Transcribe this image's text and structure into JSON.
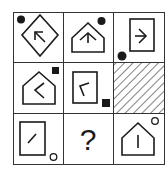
{
  "puzzle": {
    "type": "3x3 figure reasoning matrix",
    "stroke_color": "#1a1a1a",
    "background": "#ffffff",
    "cells": [
      {
        "row": 0,
        "col": 0,
        "shape": "diamond",
        "arrow": "arrow pointing up-left",
        "marker": "filled-circle",
        "marker_position": "top-left"
      },
      {
        "row": 0,
        "col": 1,
        "shape": "house (pentagon)",
        "arrow": "arrow pointing up",
        "marker": "filled-circle",
        "marker_position": "top-right"
      },
      {
        "row": 0,
        "col": 2,
        "shape": "rectangle",
        "arrow": "arrowhead pointing right",
        "marker": "filled-circle",
        "marker_position": "bottom-left"
      },
      {
        "row": 1,
        "col": 0,
        "shape": "house (pentagon)",
        "arrow": "chevron pointing left",
        "marker": "filled-square",
        "marker_position": "top-right"
      },
      {
        "row": 1,
        "col": 1,
        "shape": "rectangle",
        "arrow": "angle stroke",
        "marker": "filled-square",
        "marker_position": "bottom-right"
      },
      {
        "row": 1,
        "col": 2,
        "shape": "hatched",
        "arrow": "",
        "marker": "",
        "marker_position": ""
      },
      {
        "row": 2,
        "col": 0,
        "shape": "rectangle",
        "arrow": "diagonal line",
        "marker": "hollow-circle",
        "marker_position": "bottom-right"
      },
      {
        "row": 2,
        "col": 1,
        "shape": "question",
        "arrow": "",
        "marker": "",
        "marker_position": "",
        "label": "?"
      },
      {
        "row": 2,
        "col": 2,
        "shape": "house (pentagon)",
        "arrow": "vertical line",
        "marker": "hollow-circle",
        "marker_position": "top-right"
      }
    ],
    "question_label": "?"
  }
}
